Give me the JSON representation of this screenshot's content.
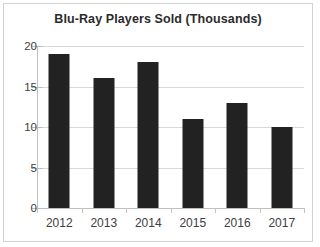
{
  "chart_data": {
    "type": "bar",
    "title": "Blu-Ray Players Sold (Thousands)",
    "xlabel": "",
    "ylabel": "",
    "categories": [
      "2012",
      "2013",
      "2014",
      "2015",
      "2016",
      "2017"
    ],
    "values": [
      19,
      16,
      18,
      11,
      13,
      10
    ],
    "ylim": [
      0,
      20
    ],
    "yticks": [
      "0",
      "5",
      "10",
      "15",
      "20"
    ],
    "ytick_values": [
      0,
      5,
      10,
      15,
      20
    ],
    "grid": "horizontal",
    "legend": "none",
    "bar_color": "#222222",
    "gridline_color": "#d9d9d9",
    "axis_color": "#bfbfbf",
    "title_color": "#2b2b2b",
    "label_color": "#404040",
    "border_color": "#d2d2d2",
    "background_color": "#ffffff"
  }
}
